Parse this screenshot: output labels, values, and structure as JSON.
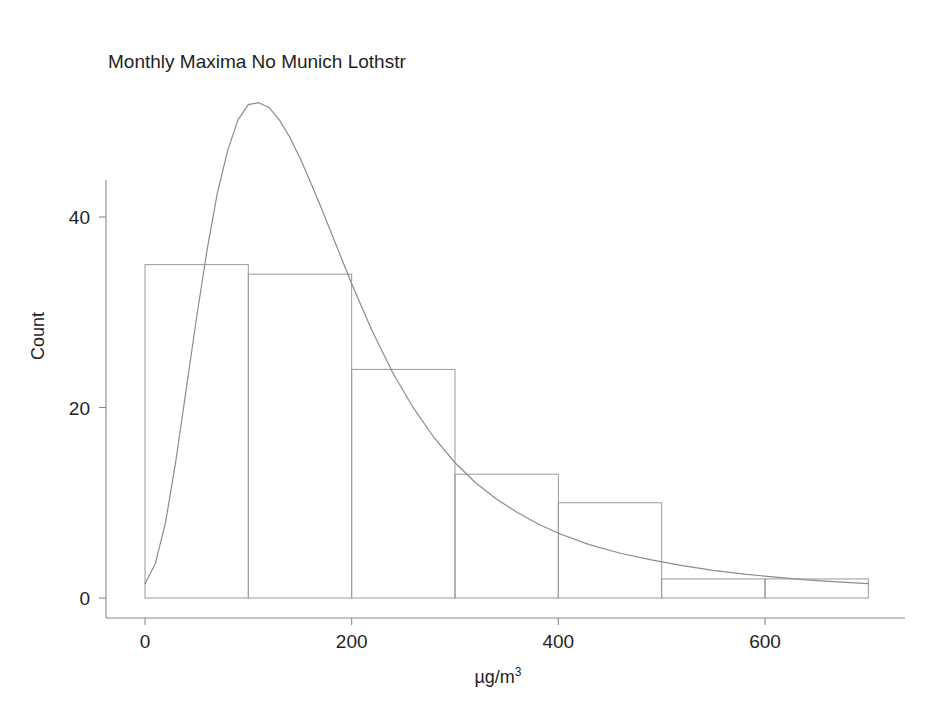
{
  "chart_data": {
    "type": "bar",
    "title": "Monthly Maxima No Munich Lothstr",
    "subtitle": "",
    "xlabel": "µg/m³",
    "ylabel": "Count",
    "xlim": [
      0,
      700
    ],
    "ylim": [
      0,
      56
    ],
    "grid": false,
    "legend": null,
    "bin_width": 100,
    "bin_edges": [
      0,
      100,
      200,
      300,
      400,
      500,
      600,
      700
    ],
    "categories": [
      "0–100",
      "100–200",
      "200–300",
      "300–400",
      "400–500",
      "500–600",
      "600–700"
    ],
    "values": [
      35,
      34,
      24,
      13,
      10,
      2,
      2
    ],
    "xticks": [
      0,
      200,
      400,
      600
    ],
    "xtick_labels": [
      "0",
      "200",
      "400",
      "600"
    ],
    "yticks": [
      0,
      20,
      40
    ],
    "ytick_labels": [
      "0",
      "20",
      "40"
    ],
    "overlay": {
      "name": "fitted density curve",
      "type": "line",
      "peak_x": 116,
      "peak_y": 52,
      "x": [
        0,
        10,
        20,
        30,
        40,
        50,
        60,
        70,
        80,
        90,
        100,
        110,
        120,
        130,
        140,
        150,
        160,
        170,
        180,
        190,
        200,
        220,
        240,
        260,
        280,
        300,
        320,
        340,
        360,
        380,
        400,
        430,
        460,
        490,
        520,
        550,
        580,
        610,
        640,
        670,
        700
      ],
      "y": [
        1.5,
        3.6,
        8.0,
        14.5,
        22.0,
        29.5,
        36.5,
        42.5,
        47.0,
        50.2,
        51.8,
        52.0,
        51.5,
        50.2,
        48.4,
        46.2,
        43.7,
        41.1,
        38.4,
        35.7,
        33.0,
        28.0,
        23.6,
        19.9,
        16.8,
        14.2,
        12.1,
        10.4,
        9.0,
        7.8,
        6.8,
        5.6,
        4.7,
        4.0,
        3.4,
        2.9,
        2.5,
        2.2,
        1.9,
        1.7,
        1.5
      ]
    }
  },
  "colors": {
    "background": "#ffffff",
    "bar_stroke": "#9a9a9a",
    "bar_fill": "none",
    "curve": "#8c8c8c",
    "axis": "#8a8a8a",
    "text": "#1f1f1f"
  },
  "axis_title_parts": {
    "x_base": "µg/m",
    "x_exponent": "3"
  }
}
